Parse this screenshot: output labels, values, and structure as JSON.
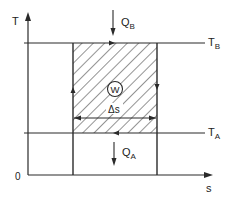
{
  "diagram": {
    "type": "T-s diagram (Carnot cycle)",
    "axes": {
      "y_label": "T",
      "x_label": "s",
      "origin_label": "0"
    },
    "levels": {
      "upper": {
        "label_main": "T",
        "label_sub": "B"
      },
      "lower": {
        "label_main": "T",
        "label_sub": "A"
      }
    },
    "heat": {
      "in": {
        "label_main": "Q",
        "label_sub": "B"
      },
      "out": {
        "label_main": "Q",
        "label_sub": "A"
      }
    },
    "work": {
      "label": "W"
    },
    "entropy_change": {
      "label": "Δs"
    },
    "colors": {
      "line": "#2a2a2a",
      "background": "#ffffff"
    }
  }
}
